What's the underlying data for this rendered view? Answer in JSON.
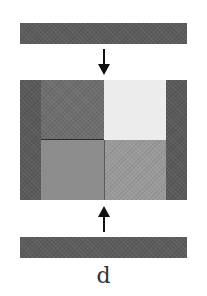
{
  "figure": {
    "panel_label": "d",
    "top_bar": {
      "color": "#5c5c5c"
    },
    "bottom_bar": {
      "color": "#5c5c5c"
    },
    "arrow_down": {
      "direction": "down",
      "color": "#111111"
    },
    "arrow_up": {
      "direction": "up",
      "color": "#111111"
    },
    "block": {
      "left_strip_color": "#5a5a5a",
      "right_strip_color": "#5a5a5a",
      "quadrants": [
        {
          "position": "top-left",
          "color": "#6e6e6e"
        },
        {
          "position": "top-right",
          "color": "#ececec"
        },
        {
          "position": "bottom-left",
          "color": "#8c8c8c"
        },
        {
          "position": "bottom-right",
          "color": "#9a9a9a"
        }
      ],
      "divider_color": "#2a2a2a"
    }
  }
}
